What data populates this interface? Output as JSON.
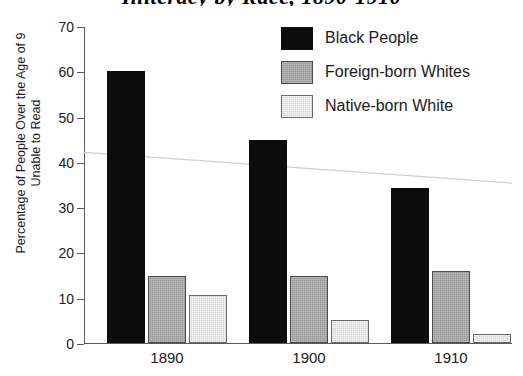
{
  "chart_data": {
    "type": "bar",
    "title": "Illiteracy by Race, 1890-1910",
    "xlabel": "",
    "ylabel_line1": "Percentage of People Over the Age of 9",
    "ylabel_line2": "Unable to Read",
    "categories": [
      "1890",
      "1900",
      "1910"
    ],
    "series": [
      {
        "name": "Black People",
        "values": [
          60,
          44.8,
          34.2
        ],
        "color": "#0c0c0c"
      },
      {
        "name": "Foreign-born Whites",
        "values": [
          14.9,
          14.8,
          15.9
        ],
        "color": "#9a9a9a"
      },
      {
        "name": "Native-born White",
        "values": [
          10.6,
          5.1,
          2.1
        ],
        "color": "#d5d5d5"
      }
    ],
    "ylim": [
      0,
      70
    ],
    "yticks": [
      0,
      10,
      20,
      30,
      40,
      50,
      60,
      70
    ],
    "ytick_labels": [
      "0",
      "10",
      "20",
      "30",
      "40",
      "50",
      "60",
      "70"
    ],
    "grid": false,
    "legend_position": "upper right",
    "annotations": [
      {
        "name": "trend-line",
        "type": "line",
        "description": "faint declining trend line",
        "x_start": "1890",
        "y_start": 41,
        "x_end": "1910",
        "y_end": 36.5,
        "color": "#cfcfcf"
      }
    ]
  },
  "legend": {
    "entries": [
      {
        "label": "Black People",
        "swatch": "series-black"
      },
      {
        "label": "Foreign-born Whites",
        "swatch": "series-foreign"
      },
      {
        "label": "Native-born White",
        "swatch": "series-native"
      }
    ]
  }
}
